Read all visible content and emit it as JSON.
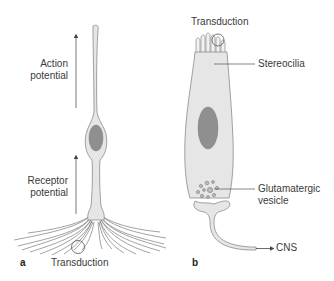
{
  "figure": {
    "panel_a": {
      "letter": "a",
      "labels": {
        "action_potential_line1": "Action",
        "action_potential_line2": "potential",
        "receptor_potential_line1": "Receptor",
        "receptor_potential_line2": "potential",
        "transduction": "Transduction"
      }
    },
    "panel_b": {
      "letter": "b",
      "labels": {
        "transduction": "Transduction",
        "stereocilia": "Stereocilia",
        "glutamatergic_line1": "Glutamatergic",
        "glutamatergic_line2": "vesicle",
        "cns": "CNS"
      }
    },
    "colors": {
      "cell_fill": "#e6e6e6",
      "cell_stroke": "#8a8a8a",
      "nucleus_fill": "#8f8f8f",
      "arrow": "#555555",
      "text": "#3a3a3a"
    }
  }
}
